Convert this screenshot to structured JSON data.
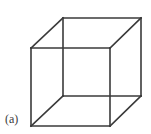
{
  "figure": {
    "kind": "necker-cube-wireframe-illustration",
    "label": "(a)",
    "caption_label": "(a)",
    "background_color": "#ffffff",
    "line_color": "#3a3a3a",
    "line_width": 1.6,
    "canvas": {
      "width": 151,
      "height": 134
    }
  },
  "chart_data": {
    "type": "diagram",
    "title": "",
    "subtitle": "",
    "xlabel": "",
    "ylabel": "",
    "grid": false,
    "legend_position": "none",
    "annotations": [
      "(a)"
    ],
    "geometry": {
      "shape": "cube",
      "rendering": "transparent wireframe (Necker cube, all 12 edges drawn)",
      "vertices": [
        {
          "id": "front-top-left",
          "x": 31,
          "y": 48
        },
        {
          "id": "front-top-right",
          "x": 110,
          "y": 48
        },
        {
          "id": "front-bottom-right",
          "x": 110,
          "y": 126
        },
        {
          "id": "front-bottom-left",
          "x": 31,
          "y": 126
        },
        {
          "id": "back-top-left",
          "x": 63,
          "y": 18
        },
        {
          "id": "back-top-right",
          "x": 141,
          "y": 18
        },
        {
          "id": "back-bottom-right",
          "x": 141,
          "y": 96
        },
        {
          "id": "back-bottom-left",
          "x": 63,
          "y": 96
        }
      ],
      "edges": [
        {
          "id": "front-top",
          "from": "front-top-left",
          "to": "front-top-right"
        },
        {
          "id": "front-right",
          "from": "front-top-right",
          "to": "front-bottom-right"
        },
        {
          "id": "front-bottom",
          "from": "front-bottom-right",
          "to": "front-bottom-left"
        },
        {
          "id": "front-left",
          "from": "front-bottom-left",
          "to": "front-top-left"
        },
        {
          "id": "back-top",
          "from": "back-top-left",
          "to": "back-top-right"
        },
        {
          "id": "back-right",
          "from": "back-top-right",
          "to": "back-bottom-right"
        },
        {
          "id": "back-bottom",
          "from": "back-bottom-right",
          "to": "back-bottom-left"
        },
        {
          "id": "back-left",
          "from": "back-bottom-left",
          "to": "back-top-left"
        },
        {
          "id": "connector-top-left",
          "from": "front-top-left",
          "to": "back-top-left"
        },
        {
          "id": "connector-top-right",
          "from": "front-top-right",
          "to": "back-top-right"
        },
        {
          "id": "connector-bottom-right",
          "from": "front-bottom-right",
          "to": "back-bottom-right"
        },
        {
          "id": "connector-bottom-left",
          "from": "front-bottom-left",
          "to": "back-bottom-left"
        }
      ],
      "front_face_size": {
        "width": 79,
        "height": 78
      },
      "depth_offset": {
        "dx": 31,
        "dy": -30
      }
    }
  }
}
